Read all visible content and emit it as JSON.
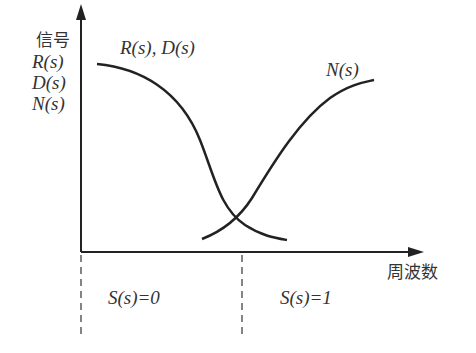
{
  "diagram": {
    "y_axis_label": {
      "title": "信号",
      "lines": [
        "R(s)",
        "D(s)",
        "N(s)"
      ]
    },
    "x_axis_label": "周波数",
    "curves": [
      {
        "name": "R(s), D(s)",
        "label": "R(s), D(s)",
        "shape": "decreasing sigmoid, high at low frequency"
      },
      {
        "name": "N(s)",
        "label": "N(s)",
        "shape": "increasing sigmoid, high at high frequency"
      }
    ],
    "regions": [
      {
        "label": "S(s)=0",
        "side": "left of crossover"
      },
      {
        "label": "S(s)=1",
        "side": "right of crossover"
      }
    ],
    "colors": {
      "stroke": "#222222",
      "text": "#333333",
      "background": "#ffffff"
    }
  }
}
